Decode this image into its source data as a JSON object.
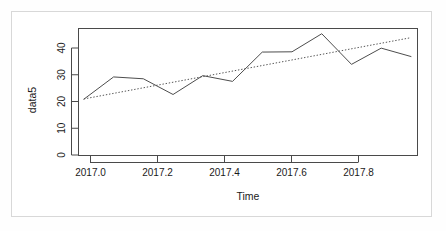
{
  "chart_data": {
    "type": "line",
    "title": "",
    "subtitle": "",
    "xlabel": "Time",
    "ylabel": "data5",
    "xlim": [
      2016.985,
      2017.935
    ],
    "ylim": [
      -2.0,
      46.5
    ],
    "grid": false,
    "legend": null,
    "legend_position": "none",
    "xticks": [
      2017.0,
      2017.2,
      2017.4,
      2017.6,
      2017.8
    ],
    "xtick_labels": [
      "2017.0",
      "2017.2",
      "2017.4",
      "2017.6",
      "2017.8"
    ],
    "yticks": [
      0,
      10,
      20,
      30,
      40
    ],
    "ytick_labels": [
      "0",
      "10",
      "20",
      "30",
      "40"
    ],
    "series": [
      {
        "name": "data5",
        "style": "solid",
        "color": "#4d4d4d",
        "x": [
          2017.0,
          2017.0833,
          2017.1667,
          2017.25,
          2017.3333,
          2017.4167,
          2017.5,
          2017.5833,
          2017.6667,
          2017.75,
          2017.8333,
          2017.9167
        ],
        "y": [
          19.5,
          28.0,
          27.3,
          21.3,
          28.5,
          26.3,
          37.5,
          37.6,
          44.5,
          32.8,
          39.0,
          35.8
        ]
      },
      {
        "name": "trend",
        "style": "dotted",
        "color": "#555555",
        "x": [
          2017.0,
          2017.9167
        ],
        "y": [
          19.6,
          43.0
        ]
      }
    ]
  },
  "axes": {
    "x_label": "Time",
    "y_label": "data5"
  }
}
